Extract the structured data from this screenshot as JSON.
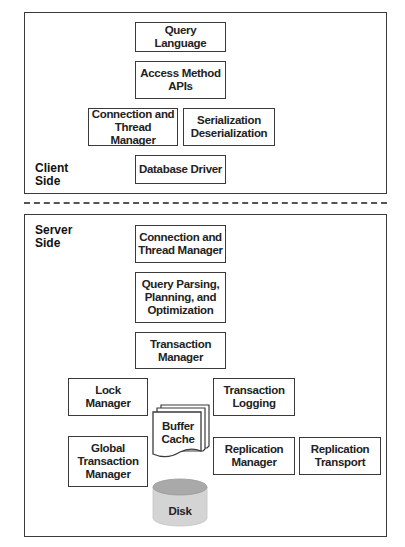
{
  "client": {
    "label": "Client\nSide",
    "components": {
      "query_language": "Query Language",
      "access_method": "Access Method\nAPIs",
      "connection": "Connection and\nThread Manager",
      "serialization": "Serialization\nDeserialization",
      "database_driver": "Database Driver"
    }
  },
  "server": {
    "label": "Server\nSide",
    "components": {
      "connection": "Connection and\nThread Manager",
      "query_parsing": "Query Parsing,\nPlanning, and\nOptimization",
      "transaction_manager": "Transaction\nManager",
      "lock_manager": "Lock\nManager",
      "transaction_logging": "Transaction\nLogging",
      "buffer_cache": "Buffer\nCache",
      "global_transaction_manager": "Global\nTransaction\nManager",
      "replication_manager": "Replication\nManager",
      "replication_transport": "Replication\nTransport",
      "disk": "Disk"
    }
  },
  "colors": {
    "border": "#3a3a3a",
    "disk_body": "#d4d4d4",
    "disk_top": "#a9a9a9"
  }
}
